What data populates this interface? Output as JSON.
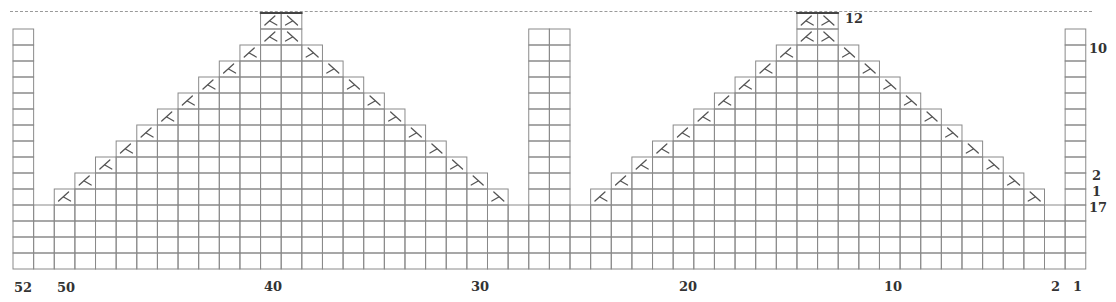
{
  "chart_data": {
    "type": "knitting-chart",
    "title": "",
    "columns": 52,
    "column_labels": [
      {
        "col": 52,
        "text": "52"
      },
      {
        "col": 50,
        "text": "50"
      },
      {
        "col": 40,
        "text": "40"
      },
      {
        "col": 30,
        "text": "30"
      },
      {
        "col": 20,
        "text": "20"
      },
      {
        "col": 10,
        "text": "10"
      },
      {
        "col": 2,
        "text": "2"
      },
      {
        "col": 1,
        "text": "1"
      }
    ],
    "row_labels": [
      {
        "row": 12,
        "text": "12",
        "side": "right-of-peak"
      },
      {
        "row": 10,
        "text": "10",
        "side": "right"
      },
      {
        "row": 2,
        "text": "2",
        "side": "right"
      },
      {
        "row": 1,
        "text": "1",
        "side": "right"
      },
      {
        "row": 0,
        "text": "17",
        "side": "right"
      }
    ],
    "base_rows": 4,
    "pattern_rows": 12,
    "tall_columns": [
      {
        "cols": [
          52
        ],
        "rows_top": 11
      },
      {
        "cols": [
          27,
          26
        ],
        "rows_top": 11
      },
      {
        "cols": [
          1
        ],
        "rows_top": 11
      }
    ],
    "triangles": [
      {
        "name": "left-triangle",
        "row1_from_col": 50,
        "row1_to_col": 29,
        "peak_cols": [
          40,
          39
        ],
        "peak_rows": [
          11,
          12
        ]
      },
      {
        "name": "right-triangle",
        "row1_from_col": 24,
        "row1_to_col": 3,
        "peak_cols": [
          14,
          13
        ],
        "peak_rows": [
          11,
          12
        ]
      }
    ],
    "symbols": {
      "left_edge": "ssk-decrease",
      "right_edge": "k2tog-decrease"
    },
    "grid": true
  },
  "labels": {
    "col52": "52",
    "col50": "50",
    "col40": "40",
    "col30": "30",
    "col20": "20",
    "col10": "10",
    "col2": "2",
    "col1": "1",
    "row12": "12",
    "row10": "10",
    "row2": "2",
    "row1": "1",
    "row17": "17"
  },
  "colors": {
    "grid": "#8a8a8a",
    "symbol": "#555555",
    "peak_top": "#444444"
  }
}
